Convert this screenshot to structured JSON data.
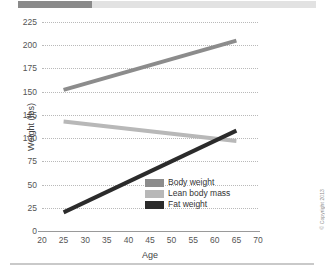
{
  "decor": {
    "top_bar_dark_color": "#8a8a8a",
    "top_bar_light_color": "#e2e2e2",
    "bottom_rule_color": "#c9c9c9"
  },
  "credit": {
    "text": "© Copyright 2013"
  },
  "chart_data": {
    "type": "line",
    "title": "",
    "xlabel": "Age",
    "ylabel": "Weight (lbs)",
    "xlim": [
      20,
      70
    ],
    "ylim": [
      0,
      225
    ],
    "xticks": [
      20,
      25,
      30,
      35,
      40,
      45,
      50,
      55,
      60,
      65,
      70
    ],
    "yticks": [
      0,
      25,
      50,
      75,
      100,
      125,
      150,
      175,
      200,
      225
    ],
    "grid": "horizontal-dotted",
    "legend_position": "lower-right-inside",
    "series": [
      {
        "name": "Body weight",
        "color": "#8c8c8c",
        "x": [
          25,
          65
        ],
        "values": [
          152,
          205
        ]
      },
      {
        "name": "Lean body mass",
        "color": "#b8b8b8",
        "x": [
          25,
          65
        ],
        "values": [
          118,
          97
        ]
      },
      {
        "name": "Fat weight",
        "color": "#2b2b2b",
        "x": [
          25,
          65
        ],
        "values": [
          20,
          108
        ]
      }
    ]
  }
}
